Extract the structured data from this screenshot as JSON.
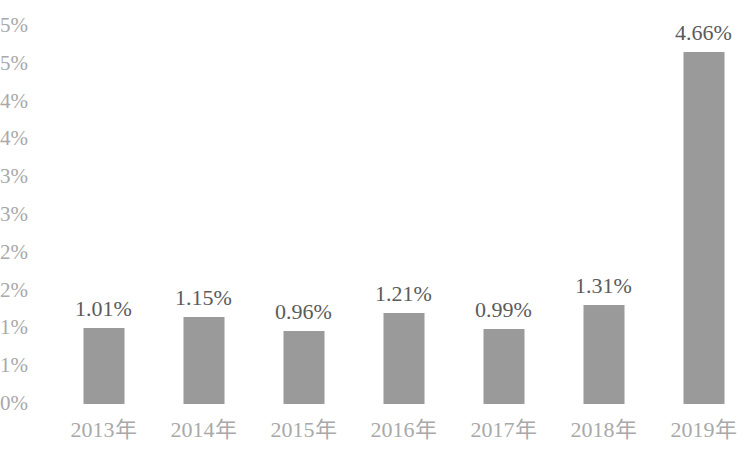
{
  "chart_data": {
    "type": "bar",
    "title": "",
    "subtitle": "",
    "xlabel": "",
    "ylabel": "",
    "categories": [
      "2013年",
      "2014年",
      "2015年",
      "2016年",
      "2017年",
      "2018年",
      "2019年"
    ],
    "values": [
      1.01,
      1.15,
      0.96,
      1.21,
      0.99,
      1.31,
      4.66
    ],
    "data_labels": [
      "1.01%",
      "1.15%",
      "0.96%",
      "1.21%",
      "0.99%",
      "1.31%",
      "4.66%"
    ],
    "ylim": [
      0,
      5
    ],
    "y_tick_values": [
      5,
      4.5,
      4,
      3.5,
      3,
      2.5,
      2,
      1.5,
      1,
      0.5,
      0
    ],
    "y_tick_labels": [
      "5%",
      "5%",
      "4%",
      "4%",
      "3%",
      "3%",
      "2%",
      "2%",
      "1%",
      "1%",
      "0%"
    ],
    "grid": false,
    "legend": false,
    "legend_position": "none",
    "series": [
      {
        "name": "",
        "values": [
          1.01,
          1.15,
          0.96,
          1.21,
          0.99,
          1.31,
          4.66
        ]
      }
    ],
    "colors": {
      "bar": "#9a9a9a",
      "data_label_text": "#5b5b5b",
      "axis_label_text": "#a9a9a9",
      "background": "#ffffff"
    }
  }
}
